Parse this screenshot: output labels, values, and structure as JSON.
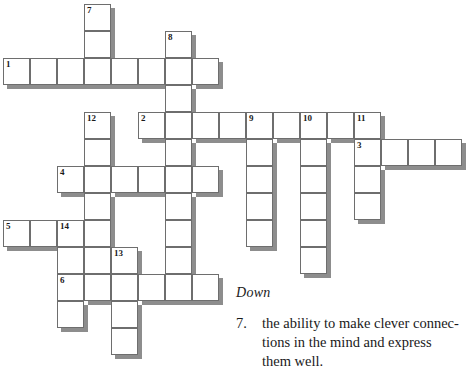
{
  "puzzle": {
    "title": "crossword-puzzle",
    "cell_size": 27,
    "origin_x": 3,
    "origin_y": 4,
    "grid_line_color": "#6e6e6e",
    "cell_fill_color": "#ffffff",
    "shadow_color": "#8d8d8d",
    "background_color": "#ffffff",
    "entries": [
      {
        "number": "1",
        "direction": "across",
        "col": 0,
        "row": 2,
        "length": 8
      },
      {
        "number": "2",
        "direction": "across",
        "col": 5,
        "row": 4,
        "length": 9
      },
      {
        "number": "3",
        "direction": "across",
        "col": 13,
        "row": 5,
        "length": 4
      },
      {
        "number": "4",
        "direction": "across",
        "col": 2,
        "row": 6,
        "length": 6
      },
      {
        "number": "5",
        "direction": "across",
        "col": 0,
        "row": 8,
        "length": 5
      },
      {
        "number": "6",
        "direction": "across",
        "col": 2,
        "row": 10,
        "length": 6
      },
      {
        "number": "7",
        "direction": "down",
        "col": 3,
        "row": 0,
        "length": 3
      },
      {
        "number": "8",
        "direction": "down",
        "col": 6,
        "row": 1,
        "length": 4
      },
      {
        "number": "9",
        "direction": "down",
        "col": 9,
        "row": 4,
        "length": 5
      },
      {
        "number": "10",
        "direction": "down",
        "col": 11,
        "row": 4,
        "length": 7
      },
      {
        "number": "11",
        "direction": "down",
        "col": 13,
        "row": 4,
        "length": 5
      },
      {
        "number": "12",
        "direction": "down",
        "col": 3,
        "row": 4,
        "length": 6
      },
      {
        "number": "13",
        "direction": "down",
        "col": 4,
        "row": 9,
        "length": 5
      },
      {
        "number": "14",
        "direction": "down",
        "col": 2,
        "row": 8,
        "length": 4
      }
    ],
    "cells": [
      {
        "col": 3,
        "row": 0,
        "number": "7"
      },
      {
        "col": 3,
        "row": 1,
        "number": ""
      },
      {
        "col": 6,
        "row": 1,
        "number": "8"
      },
      {
        "col": 0,
        "row": 2,
        "number": "1"
      },
      {
        "col": 1,
        "row": 2,
        "number": ""
      },
      {
        "col": 2,
        "row": 2,
        "number": ""
      },
      {
        "col": 3,
        "row": 2,
        "number": ""
      },
      {
        "col": 4,
        "row": 2,
        "number": ""
      },
      {
        "col": 5,
        "row": 2,
        "number": ""
      },
      {
        "col": 6,
        "row": 2,
        "number": ""
      },
      {
        "col": 7,
        "row": 2,
        "number": ""
      },
      {
        "col": 6,
        "row": 3,
        "number": ""
      },
      {
        "col": 3,
        "row": 4,
        "number": "12"
      },
      {
        "col": 5,
        "row": 4,
        "number": "2"
      },
      {
        "col": 6,
        "row": 4,
        "number": ""
      },
      {
        "col": 7,
        "row": 4,
        "number": ""
      },
      {
        "col": 8,
        "row": 4,
        "number": ""
      },
      {
        "col": 9,
        "row": 4,
        "number": "9"
      },
      {
        "col": 10,
        "row": 4,
        "number": ""
      },
      {
        "col": 11,
        "row": 4,
        "number": "10"
      },
      {
        "col": 12,
        "row": 4,
        "number": ""
      },
      {
        "col": 13,
        "row": 4,
        "number": "11"
      },
      {
        "col": 3,
        "row": 5,
        "number": ""
      },
      {
        "col": 6,
        "row": 5,
        "number": ""
      },
      {
        "col": 9,
        "row": 5,
        "number": ""
      },
      {
        "col": 11,
        "row": 5,
        "number": ""
      },
      {
        "col": 13,
        "row": 5,
        "number": "3"
      },
      {
        "col": 14,
        "row": 5,
        "number": ""
      },
      {
        "col": 15,
        "row": 5,
        "number": ""
      },
      {
        "col": 16,
        "row": 5,
        "number": ""
      },
      {
        "col": 2,
        "row": 6,
        "number": "4"
      },
      {
        "col": 3,
        "row": 6,
        "number": ""
      },
      {
        "col": 4,
        "row": 6,
        "number": ""
      },
      {
        "col": 5,
        "row": 6,
        "number": ""
      },
      {
        "col": 6,
        "row": 6,
        "number": ""
      },
      {
        "col": 7,
        "row": 6,
        "number": ""
      },
      {
        "col": 9,
        "row": 6,
        "number": ""
      },
      {
        "col": 11,
        "row": 6,
        "number": ""
      },
      {
        "col": 13,
        "row": 6,
        "number": ""
      },
      {
        "col": 3,
        "row": 7,
        "number": ""
      },
      {
        "col": 6,
        "row": 7,
        "number": ""
      },
      {
        "col": 9,
        "row": 7,
        "number": ""
      },
      {
        "col": 11,
        "row": 7,
        "number": ""
      },
      {
        "col": 13,
        "row": 7,
        "number": ""
      },
      {
        "col": 0,
        "row": 8,
        "number": "5"
      },
      {
        "col": 1,
        "row": 8,
        "number": ""
      },
      {
        "col": 2,
        "row": 8,
        "number": "14"
      },
      {
        "col": 3,
        "row": 8,
        "number": ""
      },
      {
        "col": 6,
        "row": 8,
        "number": ""
      },
      {
        "col": 9,
        "row": 8,
        "number": ""
      },
      {
        "col": 11,
        "row": 8,
        "number": ""
      },
      {
        "col": 2,
        "row": 9,
        "number": ""
      },
      {
        "col": 3,
        "row": 9,
        "number": ""
      },
      {
        "col": 4,
        "row": 9,
        "number": "13"
      },
      {
        "col": 6,
        "row": 9,
        "number": ""
      },
      {
        "col": 11,
        "row": 9,
        "number": ""
      },
      {
        "col": 2,
        "row": 10,
        "number": "6"
      },
      {
        "col": 3,
        "row": 10,
        "number": ""
      },
      {
        "col": 4,
        "row": 10,
        "number": ""
      },
      {
        "col": 5,
        "row": 10,
        "number": ""
      },
      {
        "col": 6,
        "row": 10,
        "number": ""
      },
      {
        "col": 7,
        "row": 10,
        "number": ""
      },
      {
        "col": 2,
        "row": 11,
        "number": ""
      },
      {
        "col": 4,
        "row": 11,
        "number": ""
      },
      {
        "col": 4,
        "row": 12,
        "number": ""
      }
    ]
  },
  "clues": {
    "heading": "Down",
    "items": [
      {
        "number": "7.",
        "text": "the ability to make clever connec­tions in the mind and express them well."
      }
    ]
  }
}
